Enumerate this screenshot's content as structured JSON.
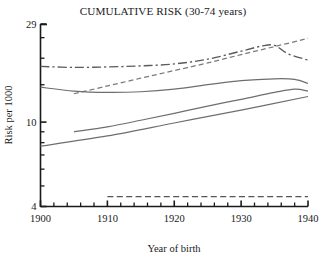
{
  "chart_data": {
    "type": "line",
    "title": "CUMULATIVE RISK (30-74 years)",
    "xlabel": "Year of birth",
    "ylabel": "Risk per 1000",
    "xlim": [
      1900,
      1940
    ],
    "ylim": [
      4,
      29
    ],
    "yscale": "log",
    "grid": false,
    "legend": "none",
    "xticks": [
      1900,
      1910,
      1920,
      1930,
      1940
    ],
    "xtick_labels": [
      "1900",
      "1910",
      "1920",
      "1930",
      "1940"
    ],
    "xminor_step": 2,
    "yticks": [
      4,
      10,
      29
    ],
    "ytick_labels": [
      "4",
      "10",
      "29"
    ],
    "yminor_ticks": [
      5,
      6,
      7,
      8,
      9,
      15,
      20,
      25
    ],
    "series": [
      {
        "name": "series-1-dashdot-upper",
        "style": "dashdot",
        "x": [
          1900,
          1905,
          1910,
          1915,
          1920,
          1925,
          1930,
          1933,
          1935,
          1937,
          1940
        ],
        "values": [
          18.3,
          18.1,
          18.2,
          18.4,
          18.8,
          19.8,
          21.6,
          22.8,
          23.0,
          21.0,
          19.6
        ]
      },
      {
        "name": "series-2-dashed-rising",
        "style": "dashed",
        "x": [
          1905,
          1910,
          1915,
          1920,
          1925,
          1930,
          1935,
          1940
        ],
        "values": [
          13.6,
          14.8,
          16.1,
          17.5,
          19.0,
          20.8,
          22.7,
          24.8
        ]
      },
      {
        "name": "series-3-solid-upper",
        "style": "solid",
        "x": [
          1900,
          1905,
          1910,
          1915,
          1920,
          1925,
          1930,
          1935,
          1938,
          1940
        ],
        "values": [
          14.6,
          14.0,
          13.8,
          13.9,
          14.3,
          15.0,
          15.7,
          16.0,
          15.9,
          15.2
        ]
      },
      {
        "name": "series-4-solid-lower",
        "style": "solid",
        "x": [
          1905,
          1910,
          1915,
          1920,
          1925,
          1930,
          1935,
          1938,
          1940
        ],
        "values": [
          9.0,
          9.5,
          10.2,
          11.0,
          11.9,
          12.8,
          13.8,
          14.3,
          14.0
        ]
      },
      {
        "name": "series-5-solid-bottom",
        "style": "solid",
        "x": [
          1900,
          1910,
          1920,
          1930,
          1940
        ],
        "values": [
          7.7,
          8.6,
          9.9,
          11.4,
          13.2
        ]
      },
      {
        "name": "series-6-dashed-flat",
        "style": "dashed",
        "x": [
          1910,
          1920,
          1930,
          1940
        ],
        "values": [
          4.45,
          4.45,
          4.45,
          4.45
        ]
      }
    ]
  },
  "colors": {
    "axis": "#1a1a1a",
    "line_solid": "#6e6e6e",
    "line_dashdot": "#5a5a5a",
    "line_dashed": "#7a7a7a",
    "line_flat": "#555555",
    "background": "#ffffff"
  }
}
